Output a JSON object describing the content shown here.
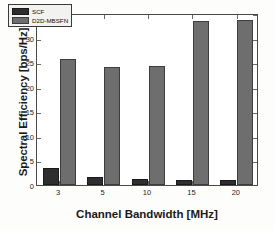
{
  "chart_data": {
    "type": "bar",
    "title": "",
    "xlabel": "Channel Bandwidth  [MHz]",
    "ylabel": "Spectral Efficiency [bps/Hz]",
    "categories": [
      "3",
      "5",
      "10",
      "15",
      "20"
    ],
    "series": [
      {
        "name": "SCF",
        "color": "#2e2e2e",
        "values": [
          3.5,
          1.6,
          1.2,
          1.0,
          1.1
        ]
      },
      {
        "name": "D2D-MBSFN",
        "color": "#6e6e6e",
        "values": [
          25.6,
          24.0,
          24.2,
          33.3,
          33.5
        ]
      }
    ],
    "ylim": [
      0,
      35
    ],
    "yticks": [
      0,
      5,
      10,
      15,
      20,
      25,
      30,
      35
    ],
    "ytick_labels": [
      "0",
      "5",
      "10",
      "15",
      "20",
      "25",
      "30",
      "35"
    ],
    "xtick_labels": [
      "3",
      "5",
      "10",
      "15",
      "20"
    ],
    "grid": false,
    "legend_position": "upper left",
    "legend_entries": [
      "SCF",
      "D2D-MBSFN"
    ],
    "axis_frame": true
  }
}
